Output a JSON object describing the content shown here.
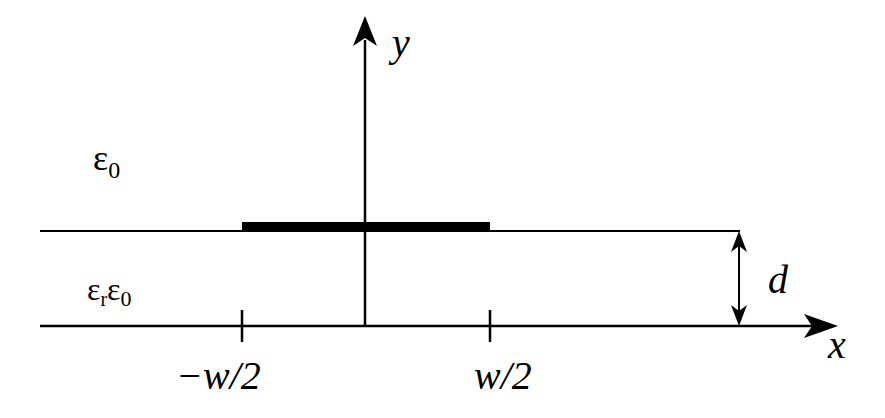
{
  "diagram": {
    "type": "microstrip-cross-section",
    "axes": {
      "x_label": "x",
      "y_label": "y"
    },
    "regions": {
      "upper": {
        "label_base": "ε",
        "label_sub": "0"
      },
      "lower": {
        "label_base1": "ε",
        "label_sub1": "r",
        "label_base2": "ε",
        "label_sub2": "0"
      }
    },
    "ticks": {
      "left": "−w/2",
      "right": "w/2"
    },
    "dimension": {
      "label": "d"
    },
    "colors": {
      "line": "#000000",
      "background": "#ffffff"
    }
  }
}
